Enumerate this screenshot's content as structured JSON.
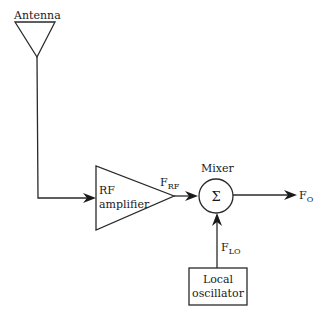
{
  "diagram": {
    "antenna": {
      "label": "Antenna"
    },
    "rf_amplifier": {
      "line1": "RF",
      "line2": "amplifier"
    },
    "rf_signal": {
      "main": "F",
      "sub": "RF"
    },
    "mixer": {
      "label": "Mixer",
      "symbol": "Σ"
    },
    "output_signal": {
      "main": "F",
      "sub": "O"
    },
    "lo_signal": {
      "main": "F",
      "sub": "LO"
    },
    "local_oscillator": {
      "line1": "Local",
      "line2": "oscillator"
    },
    "colors": {
      "stroke": "#2a2a2a",
      "text": "#1a1a1a",
      "background": "#ffffff"
    }
  }
}
